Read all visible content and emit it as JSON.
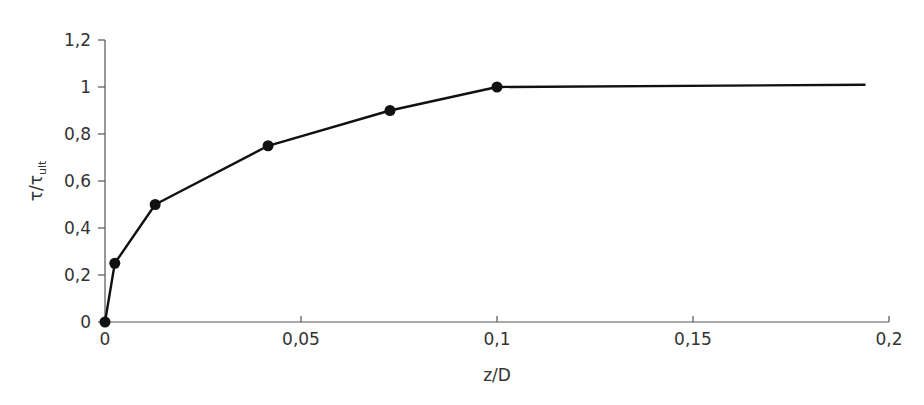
{
  "chart_data": {
    "type": "line",
    "title": "",
    "xlabel": "z/D",
    "ylabel": "τ/τ_ult",
    "ylabel_main": "τ/τ",
    "ylabel_sub": "ult",
    "xlim": [
      0,
      0.2
    ],
    "ylim": [
      0,
      1.2
    ],
    "xticks": [
      0,
      0.05,
      0.1,
      0.15,
      0.2
    ],
    "xtick_labels": [
      "0",
      "0,05",
      "0,1",
      "0,15",
      "0,2"
    ],
    "yticks": [
      0,
      0.2,
      0.4,
      0.6,
      0.8,
      1.0,
      1.2
    ],
    "ytick_labels": [
      "0",
      "0,2",
      "0,4",
      "0,6",
      "0,8",
      "1",
      "1,2"
    ],
    "grid": false,
    "legend": null,
    "series": [
      {
        "name": "τ/τult vs z/D",
        "x": [
          0,
          0.0025,
          0.0128,
          0.0416,
          0.0727,
          0.1,
          0.194
        ],
        "y": [
          0,
          0.25,
          0.5,
          0.75,
          0.9,
          1.0,
          1.0
        ],
        "markers": [
          true,
          true,
          true,
          true,
          true,
          true,
          false
        ],
        "color": "#111111"
      }
    ]
  }
}
